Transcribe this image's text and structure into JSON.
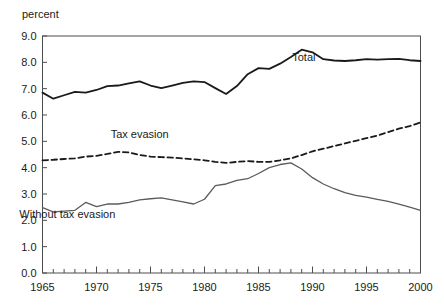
{
  "chart_data": {
    "type": "line",
    "title": "",
    "subtitle": "",
    "xlabel": "",
    "ylabel": "percent",
    "unit_label": "percent",
    "xlim": [
      1965,
      2000
    ],
    "ylim": [
      0.0,
      9.0
    ],
    "grid": false,
    "legend_position": "inline-annotations",
    "x_ticks": [
      1965,
      1966,
      1967,
      1968,
      1969,
      1970,
      1971,
      1972,
      1973,
      1974,
      1975,
      1976,
      1977,
      1978,
      1979,
      1980,
      1981,
      1982,
      1983,
      1984,
      1985,
      1986,
      1987,
      1988,
      1989,
      1990,
      1991,
      1992,
      1993,
      1994,
      1995,
      1996,
      1997,
      1998,
      1999,
      2000
    ],
    "x_tick_labels": [
      "1965",
      "1970",
      "1975",
      "1980",
      "1985",
      "1990",
      "1995",
      "2000"
    ],
    "x_tick_label_values": [
      1965,
      1970,
      1975,
      1980,
      1985,
      1990,
      1995,
      2000
    ],
    "y_ticks": [
      0.0,
      1.0,
      2.0,
      3.0,
      4.0,
      5.0,
      6.0,
      7.0,
      8.0,
      9.0
    ],
    "y_tick_labels": [
      "0.0",
      "1.0",
      "2.0",
      "3.0",
      "4.0",
      "5.0",
      "6.0",
      "7.0",
      "8.0",
      "9.0"
    ],
    "x": [
      1965,
      1966,
      1967,
      1968,
      1969,
      1970,
      1971,
      1972,
      1973,
      1974,
      1975,
      1976,
      1977,
      1978,
      1979,
      1980,
      1981,
      1982,
      1983,
      1984,
      1985,
      1986,
      1987,
      1988,
      1989,
      1990,
      1991,
      1992,
      1993,
      1994,
      1995,
      1996,
      1997,
      1998,
      1999,
      2000
    ],
    "series": [
      {
        "name": "Total",
        "style": "solid",
        "color": "#1a1a1a",
        "width": 1.8,
        "label_x": 1989.2,
        "label_y": 8.05,
        "values": [
          6.85,
          6.62,
          6.75,
          6.88,
          6.85,
          6.95,
          7.1,
          7.12,
          7.2,
          7.28,
          7.12,
          7.02,
          7.12,
          7.22,
          7.28,
          7.25,
          7.02,
          6.8,
          7.1,
          7.55,
          7.78,
          7.75,
          7.95,
          8.2,
          8.48,
          8.38,
          8.12,
          8.07,
          8.05,
          8.08,
          8.12,
          8.1,
          8.12,
          8.13,
          8.08,
          8.05
        ]
      },
      {
        "name": "Tax evasion",
        "style": "dashed",
        "color": "#1a1a1a",
        "width": 1.8,
        "label_x": 1974.0,
        "label_y": 5.12,
        "values": [
          4.28,
          4.3,
          4.33,
          4.35,
          4.42,
          4.45,
          4.52,
          4.6,
          4.58,
          4.48,
          4.42,
          4.4,
          4.38,
          4.35,
          4.32,
          4.28,
          4.22,
          4.18,
          4.22,
          4.25,
          4.22,
          4.22,
          4.28,
          4.35,
          4.48,
          4.62,
          4.72,
          4.82,
          4.92,
          5.02,
          5.12,
          5.22,
          5.35,
          5.48,
          5.58,
          5.72
        ]
      },
      {
        "name": "Without tax evasion",
        "style": "solid",
        "color": "#5b5b5b",
        "width": 1.3,
        "label_x": 1967.3,
        "label_y": 2.08,
        "values": [
          2.48,
          2.32,
          2.35,
          2.38,
          2.68,
          2.52,
          2.62,
          2.62,
          2.68,
          2.78,
          2.82,
          2.85,
          2.78,
          2.7,
          2.62,
          2.8,
          3.32,
          3.38,
          3.52,
          3.58,
          3.78,
          4.0,
          4.12,
          4.18,
          3.95,
          3.62,
          3.38,
          3.2,
          3.05,
          2.95,
          2.88,
          2.8,
          2.72,
          2.62,
          2.5,
          2.38
        ]
      }
    ],
    "annotations": [
      {
        "text": "Total",
        "x": 1989.2,
        "y": 8.05
      },
      {
        "text": "Tax evasion",
        "x": 1974.0,
        "y": 5.12
      },
      {
        "text": "Without tax evasion",
        "x": 1967.3,
        "y": 2.08
      }
    ],
    "colors": {
      "axis": "#4d4d4d",
      "text": "#1a1a1a",
      "total_line": "#1a1a1a",
      "tax_evasion_line": "#1a1a1a",
      "without_tax_evasion_line": "#5b5b5b",
      "background": "#ffffff"
    }
  }
}
